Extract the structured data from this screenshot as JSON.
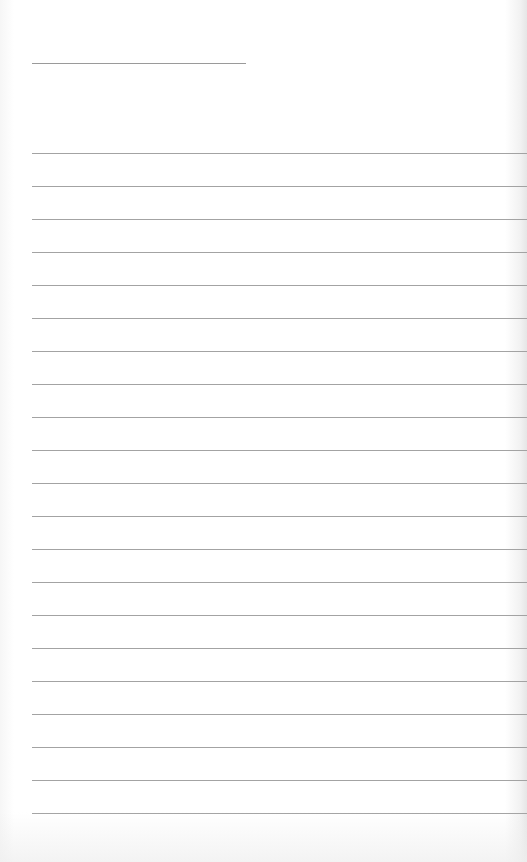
{
  "page": {
    "type": "lined-paper",
    "background_color": "#ffffff",
    "line_color": "#a3a3a3"
  },
  "title_line": {
    "x": 32,
    "y": 63,
    "width": 214
  },
  "ruled_lines": {
    "count": 21,
    "first_y": 153,
    "spacing": 33,
    "x": 32
  }
}
